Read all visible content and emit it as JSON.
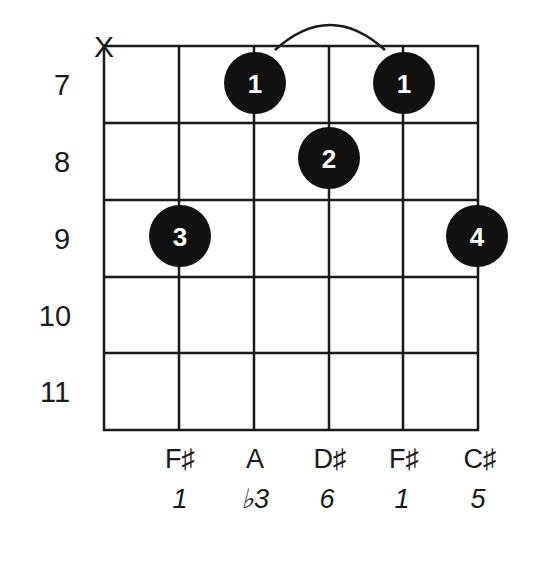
{
  "chord_diagram": {
    "muted_string_marker": "X",
    "fret_numbers": [
      "7",
      "8",
      "9",
      "10",
      "11"
    ],
    "fingers": [
      {
        "string": 3,
        "fret": 7,
        "finger": "1"
      },
      {
        "string": 5,
        "fret": 7,
        "finger": "1"
      },
      {
        "string": 4,
        "fret": 8,
        "finger": "2"
      },
      {
        "string": 2,
        "fret": 9,
        "finger": "3"
      },
      {
        "string": 6,
        "fret": 9,
        "finger": "4"
      }
    ],
    "barre": {
      "from_string": 3,
      "to_string": 5,
      "fret": 7
    },
    "notes": [
      "F♯",
      "A",
      "D♯",
      "F♯",
      "C♯"
    ],
    "intervals": [
      "1",
      "♭3",
      "6",
      "1",
      "5"
    ],
    "colors": {
      "line": "#1a1a1a",
      "dot": "#111111",
      "dot_text": "#ffffff"
    }
  }
}
